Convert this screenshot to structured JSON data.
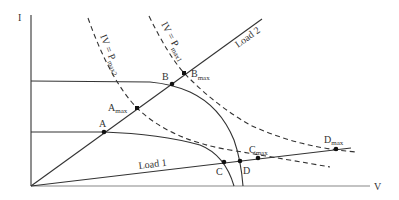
{
  "axes": {
    "y_label": "I",
    "x_label": "V"
  },
  "curves": {
    "load1_label": "Load 1",
    "load2_label": "Load 2",
    "pmax1_label_main": "IV = P",
    "pmax1_label_sub": "max1",
    "pmax2_label_main": "IV = P",
    "pmax2_label_sub": "max2"
  },
  "points": {
    "A": {
      "label": "A",
      "sub": ""
    },
    "Amax": {
      "label": "A",
      "sub": "max"
    },
    "B": {
      "label": "B",
      "sub": ""
    },
    "Bmax": {
      "label": "B",
      "sub": "max"
    },
    "C": {
      "label": "C",
      "sub": ""
    },
    "Cmax": {
      "label": "C",
      "sub": "max"
    },
    "D": {
      "label": "D",
      "sub": ""
    },
    "Dmax": {
      "label": "D",
      "sub": "max"
    }
  },
  "colors": {
    "line": "#333333",
    "background": "#ffffff"
  }
}
